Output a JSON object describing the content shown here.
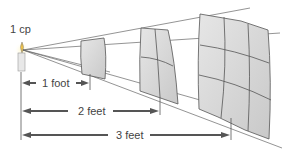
{
  "diagram": {
    "source_label": "1 cp",
    "distances": [
      {
        "label": "1 foot",
        "multiplier": 1
      },
      {
        "label": "2 feet",
        "multiplier": 2
      },
      {
        "label": "3 feet",
        "multiplier": 3
      }
    ],
    "colors": {
      "surface_fill": "#d8d8d8",
      "grid_line": "#555555",
      "arrow": "#555555",
      "text": "#444444",
      "flame": "#f5c542"
    },
    "grid_divisions": {
      "first_surface": 1,
      "second_surface": 2,
      "third_surface": 3
    }
  }
}
